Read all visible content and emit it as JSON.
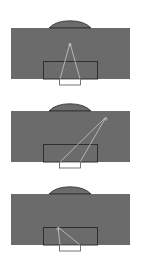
{
  "colors": {
    "pitch": "#6b6b6b",
    "lines": "#2e2e2e",
    "shot_lines": "#c8c8c8",
    "goal": "#ffffff"
  },
  "panels": [
    {
      "id": "shot-1",
      "top": 0,
      "shot": {
        "x": 70,
        "y": 43
      },
      "post_left": {
        "x": 60,
        "y": 79
      },
      "post_right": {
        "x": 80,
        "y": 79
      }
    },
    {
      "id": "shot-2",
      "top": 83,
      "shot": {
        "x": 106,
        "y": 34
      },
      "post_left": {
        "x": 60,
        "y": 79
      },
      "post_right": {
        "x": 80,
        "y": 79
      }
    },
    {
      "id": "shot-3",
      "top": 166,
      "shot": {
        "x": 58,
        "y": 61
      },
      "post_left": {
        "x": 60,
        "y": 79
      },
      "post_right": {
        "x": 80,
        "y": 79
      }
    }
  ]
}
